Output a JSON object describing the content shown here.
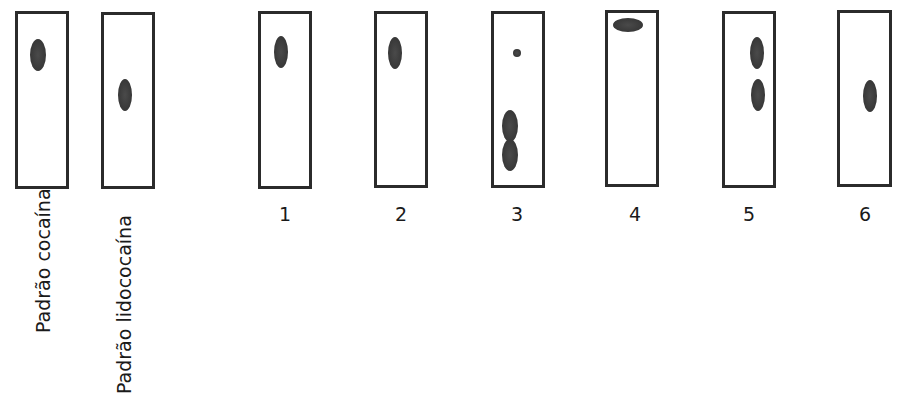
{
  "figure": {
    "spot_color": "#3a3a3a",
    "border_color": "#2b2b2b",
    "background": "#ffffff"
  },
  "standards": [
    {
      "label": "Padrão cocaína",
      "plate": {
        "x": 15,
        "y": 11,
        "w": 54,
        "h": 178
      },
      "spots": [
        {
          "cx": 38,
          "cy": 55,
          "rx": 8,
          "ry": 16
        }
      ],
      "label_pos": {
        "x": 32,
        "y": 333
      }
    },
    {
      "label": "Padrão lidococaína",
      "plate": {
        "x": 101,
        "y": 12,
        "w": 54,
        "h": 177
      },
      "spots": [
        {
          "cx": 125,
          "cy": 95,
          "rx": 7,
          "ry": 16
        }
      ],
      "label_pos": {
        "x": 113,
        "y": 394
      }
    }
  ],
  "samples": [
    {
      "label": "1",
      "plate": {
        "x": 258,
        "y": 11,
        "w": 54,
        "h": 178
      },
      "spots": [
        {
          "cx": 281,
          "cy": 52,
          "rx": 7,
          "ry": 16
        }
      ],
      "label_pos": {
        "x": 265,
        "y": 203
      }
    },
    {
      "label": "2",
      "plate": {
        "x": 374,
        "y": 11,
        "w": 54,
        "h": 177
      },
      "spots": [
        {
          "cx": 395,
          "cy": 53,
          "rx": 7,
          "ry": 16
        }
      ],
      "label_pos": {
        "x": 381,
        "y": 203
      }
    },
    {
      "label": "3",
      "plate": {
        "x": 491,
        "y": 11,
        "w": 54,
        "h": 177
      },
      "spots": [
        {
          "cx": 517,
          "cy": 53,
          "rx": 4,
          "ry": 4
        },
        {
          "cx": 510,
          "cy": 126,
          "rx": 8,
          "ry": 16
        },
        {
          "cx": 510,
          "cy": 155,
          "rx": 8,
          "ry": 16
        }
      ],
      "label_pos": {
        "x": 497,
        "y": 203
      }
    },
    {
      "label": "4",
      "plate": {
        "x": 605,
        "y": 10,
        "w": 54,
        "h": 177
      },
      "spots": [
        {
          "cx": 628,
          "cy": 25,
          "rx": 15,
          "ry": 7
        }
      ],
      "label_pos": {
        "x": 615,
        "y": 203
      }
    },
    {
      "label": "5",
      "plate": {
        "x": 722,
        "y": 11,
        "w": 54,
        "h": 177
      },
      "spots": [
        {
          "cx": 757,
          "cy": 53,
          "rx": 7,
          "ry": 16
        },
        {
          "cx": 758,
          "cy": 95,
          "rx": 7,
          "ry": 16
        }
      ],
      "label_pos": {
        "x": 729,
        "y": 203
      }
    },
    {
      "label": "6",
      "plate": {
        "x": 837,
        "y": 10,
        "w": 55,
        "h": 177
      },
      "spots": [
        {
          "cx": 870,
          "cy": 96,
          "rx": 7,
          "ry": 16
        }
      ],
      "label_pos": {
        "x": 845,
        "y": 203
      }
    }
  ]
}
